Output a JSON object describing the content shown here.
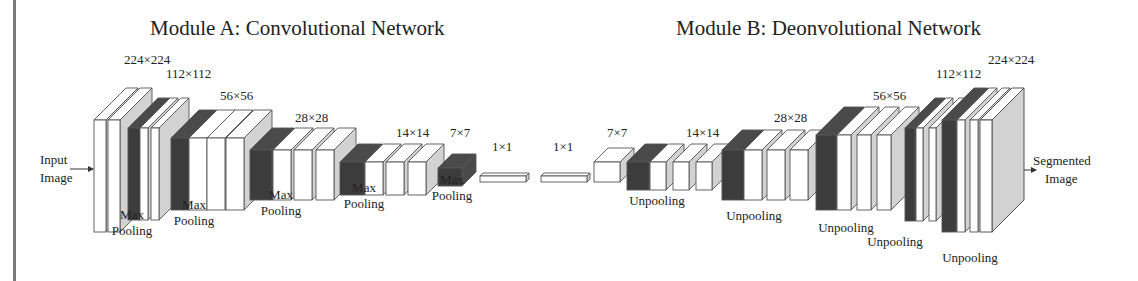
{
  "titles": {
    "module_a": "Module A: Convolutional Network",
    "module_b": "Module B: Deonvolutional Network"
  },
  "io": {
    "input_line1": "Input",
    "input_line2": "Image",
    "output_line1": "Segmented",
    "output_line2": "Image"
  },
  "colors": {
    "conv_face": "#ffffff",
    "conv_side": "#d2d2d2",
    "pool_face": "#3c3c3c",
    "pool_side": "#4a4a4a",
    "outline": "#555555",
    "border": "#7a7a7a"
  },
  "size_labels": [
    {
      "text": "224×224",
      "x": 124,
      "y": 64
    },
    {
      "text": "112×112",
      "x": 166,
      "y": 78
    },
    {
      "text": "56×56",
      "x": 220,
      "y": 100
    },
    {
      "text": "28×28",
      "x": 295,
      "y": 122
    },
    {
      "text": "14×14",
      "x": 396,
      "y": 137
    },
    {
      "text": "7×7",
      "x": 450,
      "y": 137
    },
    {
      "text": "1×1",
      "x": 492,
      "y": 151
    },
    {
      "text": "1×1",
      "x": 553,
      "y": 151
    },
    {
      "text": "7×7",
      "x": 607,
      "y": 137
    },
    {
      "text": "14×14",
      "x": 686,
      "y": 137
    },
    {
      "text": "28×28",
      "x": 774,
      "y": 122
    },
    {
      "text": "56×56",
      "x": 873,
      "y": 100
    },
    {
      "text": "112×112",
      "x": 936,
      "y": 78
    },
    {
      "text": "224×224",
      "x": 988,
      "y": 64
    }
  ],
  "op_labels": [
    {
      "lines": [
        "Max",
        "Pooling"
      ],
      "x": 132,
      "y": 235
    },
    {
      "lines": [
        "Max",
        "Pooling"
      ],
      "x": 194,
      "y": 225
    },
    {
      "lines": [
        "Max",
        "Pooling"
      ],
      "x": 281,
      "y": 215
    },
    {
      "lines": [
        "Max",
        "Pooling"
      ],
      "x": 364,
      "y": 208
    },
    {
      "lines": [
        "Max",
        "Pooling"
      ],
      "x": 452,
      "y": 200
    },
    {
      "lines": [
        "Unpooling"
      ],
      "x": 657,
      "y": 205
    },
    {
      "lines": [
        "Unpooling"
      ],
      "x": 754,
      "y": 220
    },
    {
      "lines": [
        "Unpooling"
      ],
      "x": 846,
      "y": 232
    },
    {
      "lines": [
        "Unpooling"
      ],
      "x": 895,
      "y": 246
    },
    {
      "lines": [
        "Unpooling"
      ],
      "x": 970,
      "y": 262
    }
  ],
  "blocks": [
    {
      "type": "conv",
      "x": 94,
      "y": 120,
      "w": 12,
      "h": 112,
      "d": 32
    },
    {
      "type": "conv",
      "x": 108,
      "y": 120,
      "w": 12,
      "h": 112,
      "d": 32
    },
    {
      "type": "pool",
      "x": 128,
      "y": 128,
      "w": 12,
      "h": 92,
      "d": 30
    },
    {
      "type": "conv",
      "x": 140,
      "y": 128,
      "w": 8,
      "h": 92,
      "d": 30
    },
    {
      "type": "conv",
      "x": 151,
      "y": 128,
      "w": 8,
      "h": 92,
      "d": 30
    },
    {
      "type": "pool",
      "x": 171,
      "y": 138,
      "w": 18,
      "h": 72,
      "d": 28
    },
    {
      "type": "conv",
      "x": 189,
      "y": 138,
      "w": 18,
      "h": 72,
      "d": 28
    },
    {
      "type": "conv",
      "x": 207,
      "y": 138,
      "w": 18,
      "h": 72,
      "d": 28
    },
    {
      "type": "conv",
      "x": 226,
      "y": 138,
      "w": 18,
      "h": 72,
      "d": 28
    },
    {
      "type": "pool",
      "x": 250,
      "y": 150,
      "w": 22,
      "h": 50,
      "d": 22
    },
    {
      "type": "conv",
      "x": 273,
      "y": 150,
      "w": 18,
      "h": 50,
      "d": 22
    },
    {
      "type": "conv",
      "x": 294,
      "y": 150,
      "w": 18,
      "h": 50,
      "d": 22
    },
    {
      "type": "conv",
      "x": 316,
      "y": 150,
      "w": 18,
      "h": 50,
      "d": 22
    },
    {
      "type": "pool",
      "x": 340,
      "y": 162,
      "w": 24,
      "h": 33,
      "d": 18
    },
    {
      "type": "conv",
      "x": 365,
      "y": 162,
      "w": 18,
      "h": 33,
      "d": 18
    },
    {
      "type": "conv",
      "x": 386,
      "y": 162,
      "w": 18,
      "h": 33,
      "d": 18
    },
    {
      "type": "conv",
      "x": 408,
      "y": 162,
      "w": 18,
      "h": 33,
      "d": 18
    },
    {
      "type": "pool",
      "x": 438,
      "y": 168,
      "w": 24,
      "h": 18,
      "d": 14
    },
    {
      "type": "conv",
      "x": 480,
      "y": 176,
      "w": 46,
      "h": 6,
      "d": 3
    },
    {
      "type": "conv",
      "x": 541,
      "y": 176,
      "w": 46,
      "h": 6,
      "d": 3
    },
    {
      "type": "conv",
      "x": 594,
      "y": 162,
      "w": 26,
      "h": 20,
      "d": 14
    },
    {
      "type": "pool",
      "x": 627,
      "y": 162,
      "w": 22,
      "h": 28,
      "d": 18
    },
    {
      "type": "conv",
      "x": 650,
      "y": 162,
      "w": 16,
      "h": 28,
      "d": 18
    },
    {
      "type": "conv",
      "x": 673,
      "y": 162,
      "w": 16,
      "h": 28,
      "d": 18
    },
    {
      "type": "conv",
      "x": 696,
      "y": 162,
      "w": 16,
      "h": 28,
      "d": 18
    },
    {
      "type": "pool",
      "x": 722,
      "y": 150,
      "w": 22,
      "h": 50,
      "d": 20
    },
    {
      "type": "conv",
      "x": 744,
      "y": 150,
      "w": 18,
      "h": 50,
      "d": 20
    },
    {
      "type": "conv",
      "x": 767,
      "y": 150,
      "w": 18,
      "h": 50,
      "d": 20
    },
    {
      "type": "conv",
      "x": 790,
      "y": 150,
      "w": 18,
      "h": 50,
      "d": 20
    },
    {
      "type": "pool",
      "x": 816,
      "y": 135,
      "w": 20,
      "h": 75,
      "d": 28
    },
    {
      "type": "conv",
      "x": 837,
      "y": 135,
      "w": 14,
      "h": 75,
      "d": 28
    },
    {
      "type": "conv",
      "x": 857,
      "y": 135,
      "w": 14,
      "h": 75,
      "d": 28
    },
    {
      "type": "conv",
      "x": 877,
      "y": 135,
      "w": 14,
      "h": 75,
      "d": 28
    },
    {
      "type": "pool",
      "x": 905,
      "y": 128,
      "w": 10,
      "h": 93,
      "d": 30
    },
    {
      "type": "conv",
      "x": 916,
      "y": 128,
      "w": 7,
      "h": 93,
      "d": 30
    },
    {
      "type": "conv",
      "x": 929,
      "y": 128,
      "w": 7,
      "h": 93,
      "d": 30
    },
    {
      "type": "pool",
      "x": 942,
      "y": 120,
      "w": 14,
      "h": 112,
      "d": 32
    },
    {
      "type": "conv",
      "x": 957,
      "y": 120,
      "w": 8,
      "h": 112,
      "d": 32
    },
    {
      "type": "conv",
      "x": 970,
      "y": 120,
      "w": 8,
      "h": 112,
      "d": 32
    }
  ]
}
